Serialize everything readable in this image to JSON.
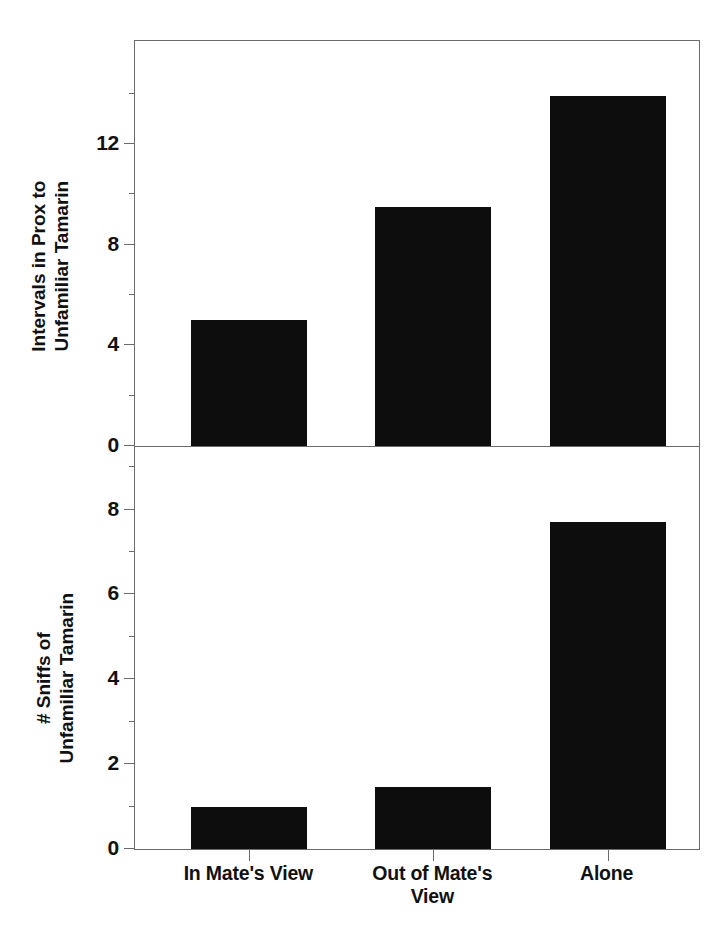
{
  "chart_data": [
    {
      "panel": "top",
      "type": "bar",
      "title": "",
      "xlabel": "",
      "ylabel": "Intervals in Prox to Unfamiliar Tamarin",
      "ylabel_line1": "Intervals in Prox to",
      "ylabel_line2": "Unfamiliar Tamarin",
      "categories": [
        "In Mate's View",
        "Out of Mate's View",
        "Alone"
      ],
      "values": [
        5.0,
        9.5,
        13.9
      ],
      "ylim": [
        0,
        16.05
      ],
      "yticks": [
        0,
        4,
        8,
        12
      ],
      "ytick_labels": [
        "0",
        "4",
        "8",
        "12"
      ],
      "yminor_ticks": [
        2,
        6,
        10,
        14
      ],
      "grid": false,
      "legend": "none",
      "bar_color": "#0d0d0d"
    },
    {
      "panel": "bottom",
      "type": "bar",
      "title": "",
      "xlabel": "",
      "ylabel": "# Sniffs of Unfamiliar Tamarin",
      "ylabel_line1": "# Sniffs of",
      "ylabel_line2": "Unfamiliar Tamarin",
      "categories": [
        "In Mate's View",
        "Out of Mate's View",
        "Alone"
      ],
      "values": [
        1.0,
        1.45,
        7.7
      ],
      "ylim": [
        0,
        9.45
      ],
      "yticks": [
        0,
        2,
        4,
        6,
        8
      ],
      "ytick_labels": [
        "0",
        "2",
        "4",
        "6",
        "8"
      ],
      "yminor_ticks": [
        1,
        3,
        5,
        7,
        9
      ],
      "grid": false,
      "legend": "none",
      "bar_color": "#0d0d0d"
    }
  ],
  "axis": {
    "x_categories": [
      {
        "label": "In Mate's View",
        "line1": "In Mate's View",
        "line2": ""
      },
      {
        "label": "Out of Mate's View",
        "line1": "Out of Mate's",
        "line2": "View"
      },
      {
        "label": "Alone",
        "line1": "Alone",
        "line2": ""
      }
    ]
  },
  "colors": {
    "bar": "#0d0d0d",
    "axis": "#6b6b6b",
    "text": "#111111",
    "background": "#ffffff"
  }
}
